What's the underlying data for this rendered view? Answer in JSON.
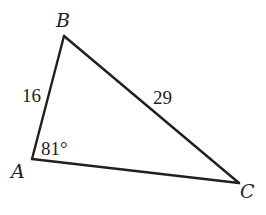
{
  "diagram": {
    "type": "triangle",
    "stroke_color": "#231f20",
    "background": "#ffffff",
    "vertices": {
      "A": {
        "label": "A",
        "x": 32,
        "y": 159
      },
      "B": {
        "label": "B",
        "x": 64,
        "y": 36
      },
      "C": {
        "label": "C",
        "x": 239,
        "y": 183
      }
    },
    "sides": {
      "AB": {
        "label": "16"
      },
      "BC": {
        "label": "29"
      },
      "AC": {
        "label": ""
      }
    },
    "angles": {
      "A": {
        "label": "81°"
      }
    }
  }
}
